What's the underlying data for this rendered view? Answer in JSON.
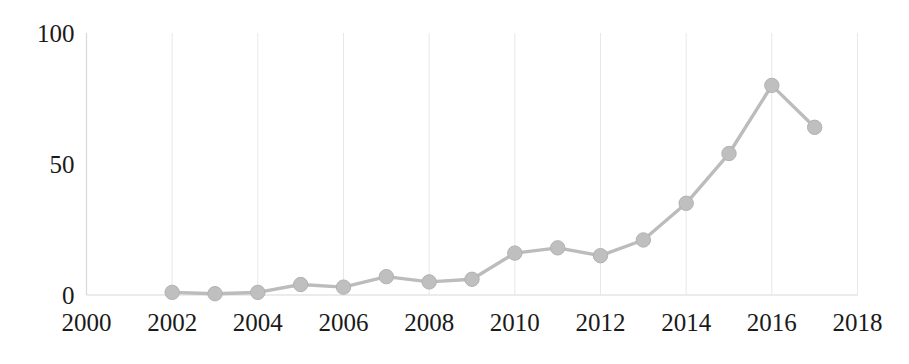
{
  "chart_data": {
    "type": "line",
    "title": "",
    "subtitle": "",
    "xlabel": "",
    "ylabel": "",
    "x": [
      2002,
      2003,
      2004,
      2005,
      2006,
      2007,
      2008,
      2009,
      2010,
      2011,
      2012,
      2013,
      2014,
      2015,
      2016,
      2017
    ],
    "values": [
      1,
      0.5,
      1,
      4,
      3,
      7,
      5,
      6,
      16,
      18,
      15,
      21,
      35,
      54,
      80,
      64
    ],
    "series": [
      {
        "name": "",
        "values": [
          1,
          0.5,
          1,
          4,
          3,
          7,
          5,
          6,
          16,
          18,
          15,
          21,
          35,
          54,
          80,
          64
        ]
      }
    ],
    "xlim": [
      2000,
      2018
    ],
    "ylim": [
      0,
      100
    ],
    "x_tick_labels": [
      "2000",
      "2002",
      "2004",
      "2006",
      "2008",
      "2010",
      "2012",
      "2014",
      "2016",
      "2018"
    ],
    "x_tick_values": [
      2000,
      2002,
      2004,
      2006,
      2008,
      2010,
      2012,
      2014,
      2016,
      2018
    ],
    "y_tick_labels": [
      "0",
      "50",
      "100"
    ],
    "y_tick_values": [
      0,
      50,
      100
    ],
    "grid": "vertical-only",
    "legend": "none",
    "marker": "circle",
    "colors": {
      "line": "#bcbcbc",
      "marker": "#bfbfbf",
      "gridline": "#e8e8e8",
      "axis": "#d8d8d8",
      "tick_text": "#1a1a1a",
      "background": "#ffffff"
    }
  }
}
